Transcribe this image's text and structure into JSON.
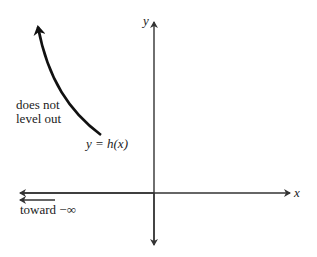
{
  "diagram": {
    "type": "function-graph-sketch",
    "axes": {
      "x_label": "x",
      "y_label": "y"
    },
    "curve": {
      "label": "y = h(x)",
      "annotation": "does not level out",
      "annotation_lines": [
        "does not",
        "level out"
      ]
    },
    "left_arrow_label": "toward −∞",
    "colors": {
      "stroke": "#111111",
      "axis": "#333333",
      "text": "#222222"
    }
  }
}
